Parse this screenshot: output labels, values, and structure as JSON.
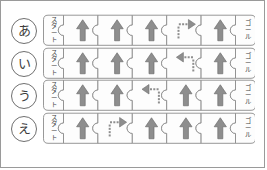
{
  "figure": {
    "colors": {
      "arrow_fill": "#8e8e8e",
      "arrow_stroke": "#6f6f6f",
      "piece_stroke": "#8c8c8c",
      "piece_fill": "#fdfdfd",
      "label_text": "#3d3d3d",
      "border": "#9a9a9a"
    },
    "start_label": "スタート",
    "goal_label": "ゴール",
    "pieces_per_row": 5
  },
  "rows": [
    {
      "label": "あ",
      "start": "スタート",
      "goal": "ゴール",
      "cells": [
        "up",
        "up",
        "up",
        "dotted-right",
        "up"
      ]
    },
    {
      "label": "い",
      "start": "スタート",
      "goal": "ゴール",
      "cells": [
        "up",
        "up",
        "up",
        "dotted-left",
        "up"
      ]
    },
    {
      "label": "う",
      "start": "スタート",
      "goal": "ゴール",
      "cells": [
        "up",
        "up",
        "dotted-left",
        "up",
        "up"
      ]
    },
    {
      "label": "え",
      "start": "スタート",
      "goal": "ゴール",
      "cells": [
        "up",
        "dotted-right",
        "up",
        "up",
        "up"
      ]
    }
  ]
}
